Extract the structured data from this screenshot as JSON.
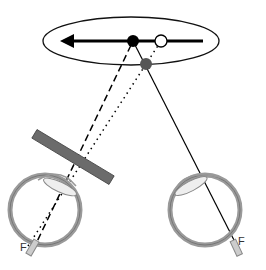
{
  "diagram": {
    "type": "pulfrich-effect-illustration",
    "labels": {
      "left_fovea": "F",
      "right_fovea": "F"
    },
    "elements": {
      "orbit_ellipse": {
        "cx": 131,
        "cy": 41,
        "rx": 88,
        "ry": 24
      },
      "motion_arrow": {
        "x1": 203,
        "x2": 62,
        "y": 41,
        "direction": "left"
      },
      "actual_position_dot": {
        "cx": 133,
        "cy": 41,
        "r": 6,
        "fill": "#000000"
      },
      "delayed_position_circle": {
        "cx": 161,
        "cy": 41,
        "r": 6,
        "fill": "none"
      },
      "perceived_position_dot": {
        "cx": 146,
        "cy": 64,
        "r": 6,
        "fill": "#555555"
      },
      "neutral_density_filter": {
        "color": "#6b6b6b",
        "x1": 35,
        "y1": 134,
        "x2": 111,
        "y2": 180,
        "thickness": 10
      },
      "left_eye": {
        "cx": 45,
        "cy": 210,
        "r": 35
      },
      "right_eye": {
        "cx": 205,
        "cy": 210,
        "r": 35
      }
    },
    "lines": [
      {
        "name": "left-eye-dashed-line",
        "style": "dashed",
        "from": "left fovea",
        "to": "actual position"
      },
      {
        "name": "left-eye-dotted-line",
        "style": "dotted",
        "from": "left fovea",
        "to": "delayed position"
      },
      {
        "name": "right-eye-solid-line",
        "style": "solid",
        "from": "right fovea",
        "to": "actual position"
      }
    ],
    "colors": {
      "stroke": "#000000",
      "eye_fill": "#e6e6e6",
      "eye_stroke": "#8a8a8a",
      "filter": "#6b6b6b",
      "perceived_dot": "#555555"
    }
  }
}
